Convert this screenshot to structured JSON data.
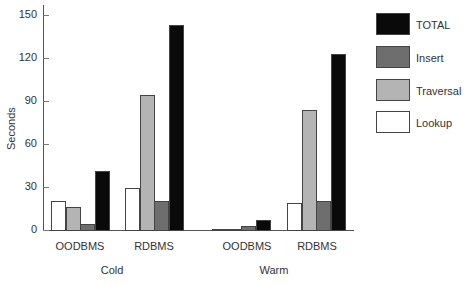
{
  "chart_data": {
    "type": "bar",
    "title": "",
    "xlabel": "",
    "ylabel": "Seconds",
    "ylim": [
      0,
      150
    ],
    "yticks": [
      0,
      30,
      60,
      90,
      120,
      150
    ],
    "grid": false,
    "legend_position": "right",
    "groups": [
      "Cold",
      "Warm"
    ],
    "categories": [
      "OODBMS",
      "RDBMS",
      "OODBMS",
      "RDBMS"
    ],
    "category_groups": [
      "Cold",
      "Cold",
      "Warm",
      "Warm"
    ],
    "series": [
      {
        "name": "Lookup",
        "color": "#ffffff",
        "values": [
          20,
          29,
          1,
          19
        ]
      },
      {
        "name": "Traversal",
        "color": "#b4b4b4",
        "values": [
          16,
          94,
          1,
          84
        ]
      },
      {
        "name": "Insert",
        "color": "#6e6e6e",
        "values": [
          4,
          20,
          3,
          20
        ]
      },
      {
        "name": "TOTAL",
        "color": "#0a0a0a",
        "values": [
          41,
          143,
          7,
          123
        ]
      }
    ]
  },
  "legend": {
    "items": [
      {
        "label": "TOTAL",
        "color": "#0a0a0a"
      },
      {
        "label": "Insert",
        "color": "#6e6e6e"
      },
      {
        "label": "Traversal",
        "color": "#b4b4b4"
      },
      {
        "label": "Lookup",
        "color": "#ffffff"
      }
    ]
  },
  "axis": {
    "ylabel": "Seconds",
    "ytick_labels": [
      "0",
      "30",
      "60",
      "90",
      "120",
      "150"
    ]
  },
  "labels": {
    "categories": [
      "OODBMS",
      "RDBMS",
      "OODBMS",
      "RDBMS"
    ],
    "groups": [
      "Cold",
      "Warm"
    ]
  }
}
